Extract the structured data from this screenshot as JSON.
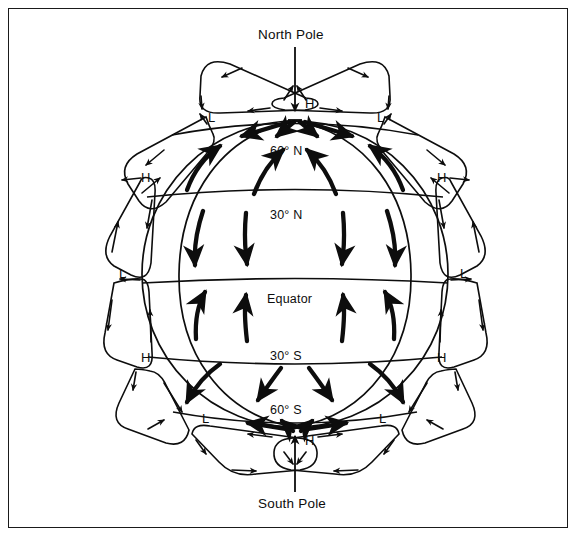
{
  "figure": {
    "kind": "global-atmospheric-circulation-diagram",
    "poles": {
      "north": "North Pole",
      "south": "South Pole"
    },
    "latitudes": [
      {
        "id": "lat-60n",
        "label": "60° N",
        "x": 296,
        "y": 152
      },
      {
        "id": "lat-30n",
        "label": "30° N",
        "x": 296,
        "y": 214
      },
      {
        "id": "lat-eq",
        "label": "Equator",
        "x": 296,
        "y": 300
      },
      {
        "id": "lat-30s",
        "label": "30° S",
        "x": 296,
        "y": 357
      },
      {
        "id": "lat-60s",
        "label": "60° S",
        "x": 296,
        "y": 411
      }
    ],
    "pressure_markers": [
      {
        "id": "h-north-pole",
        "label": "H",
        "x": 309,
        "y": 104
      },
      {
        "id": "l-north-60-left",
        "label": "L",
        "x": 211,
        "y": 118
      },
      {
        "id": "l-north-60-right",
        "label": "L",
        "x": 380,
        "y": 118
      },
      {
        "id": "h-north-30-left",
        "label": "H",
        "x": 145,
        "y": 178
      },
      {
        "id": "h-north-30-right",
        "label": "H",
        "x": 441,
        "y": 178
      },
      {
        "id": "l-equator-left",
        "label": "L",
        "x": 122,
        "y": 274
      },
      {
        "id": "l-equator-right",
        "label": "L",
        "x": 463,
        "y": 274
      },
      {
        "id": "h-south-30-left",
        "label": "H",
        "x": 145,
        "y": 358
      },
      {
        "id": "h-south-30-right",
        "label": "H",
        "x": 441,
        "y": 358
      },
      {
        "id": "l-south-60-left",
        "label": "L",
        "x": 205,
        "y": 419
      },
      {
        "id": "l-south-60-right",
        "label": "L",
        "x": 382,
        "y": 419
      },
      {
        "id": "h-south-pole",
        "label": "H",
        "x": 309,
        "y": 441
      }
    ],
    "colors": {
      "ink": "#0d0d0d",
      "frame": "#1a1a1a",
      "background": "#ffffff"
    }
  }
}
